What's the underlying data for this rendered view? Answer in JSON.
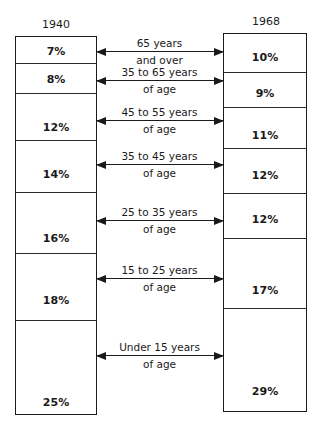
{
  "chart_data": {
    "type": "stacked-bar-comparison",
    "title": "",
    "categories": [
      "65 years and over",
      "35 to 65 years of age",
      "45 to 55 years of age",
      "35 to 45 years of age",
      "25 to 35 years of age",
      "15 to 25 years of age",
      "Under 15 years of age"
    ],
    "series": [
      {
        "name": "1940",
        "values": [
          7,
          8,
          12,
          14,
          16,
          18,
          25
        ],
        "labels": [
          "7%",
          "8%",
          "12%",
          "14%",
          "16%",
          "18%",
          "25%"
        ]
      },
      {
        "name": "1968",
        "values": [
          10,
          9,
          11,
          12,
          12,
          17,
          29
        ],
        "labels": [
          "10%",
          "9%",
          "11%",
          "12%",
          "12%",
          "17%",
          "29%"
        ]
      }
    ],
    "unit": "%"
  },
  "left": {
    "year": "1940",
    "segments": [
      {
        "label": "7%",
        "top": 0,
        "height": 26,
        "text_y": 8
      },
      {
        "label": "8%",
        "top": 26,
        "height": 30,
        "text_y": 9
      },
      {
        "label": "12%",
        "top": 56,
        "height": 47,
        "text_y": 27
      },
      {
        "label": "14%",
        "top": 103,
        "height": 52,
        "text_y": 27
      },
      {
        "label": "16%",
        "top": 155,
        "height": 61,
        "text_y": 39
      },
      {
        "label": "18%",
        "top": 216,
        "height": 67,
        "text_y": 40
      },
      {
        "label": "25%",
        "top": 283,
        "height": 95,
        "text_y": 75
      }
    ]
  },
  "right": {
    "year": "1968",
    "segments": [
      {
        "label": "10%",
        "top": 0,
        "height": 38,
        "text_y": 17
      },
      {
        "label": "9%",
        "top": 38,
        "height": 35,
        "text_y": 14
      },
      {
        "label": "11%",
        "top": 73,
        "height": 41,
        "text_y": 21
      },
      {
        "label": "12%",
        "top": 114,
        "height": 45,
        "text_y": 20
      },
      {
        "label": "12%",
        "top": 159,
        "height": 45,
        "text_y": 19
      },
      {
        "label": "17%",
        "top": 204,
        "height": 70,
        "text_y": 45
      },
      {
        "label": "29%",
        "top": 274,
        "height": 104,
        "text_y": 76
      }
    ]
  },
  "age_groups": [
    {
      "line1": "65 years",
      "line2": "and over",
      "arrow_y": 51
    },
    {
      "line1": "35 to 65 years",
      "line2": "of age",
      "arrow_y": 80
    },
    {
      "line1": "45 to 55 years",
      "line2": "of age",
      "arrow_y": 120
    },
    {
      "line1": "35 to 45 years",
      "line2": "of age",
      "arrow_y": 164
    },
    {
      "line1": "25 to 35 years",
      "line2": "of age",
      "arrow_y": 220
    },
    {
      "line1": "15 to 25 years",
      "line2": "of age",
      "arrow_y": 278
    },
    {
      "line1": "Under 15 years",
      "line2": "of age",
      "arrow_y": 355
    }
  ]
}
